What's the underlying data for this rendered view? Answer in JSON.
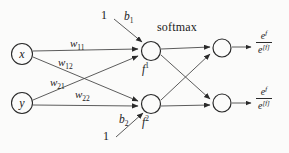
{
  "diagram": {
    "title_label": "softmax",
    "inputs": [
      {
        "id": "x",
        "label": "x"
      },
      {
        "id": "y",
        "label": "y"
      }
    ],
    "bias_constants": [
      {
        "id": "bias-top",
        "label": "1"
      },
      {
        "id": "bias-bottom",
        "label": "1"
      }
    ],
    "bias_labels": [
      {
        "id": "b1",
        "base": "b",
        "sub": "1"
      },
      {
        "id": "b2",
        "base": "b",
        "sub": "2"
      }
    ],
    "weights": [
      {
        "id": "w11",
        "base": "w",
        "sub": "11"
      },
      {
        "id": "w12",
        "base": "w",
        "sub": "12"
      },
      {
        "id": "w21",
        "base": "w",
        "sub": "21"
      },
      {
        "id": "w22",
        "base": "w",
        "sub": "22"
      }
    ],
    "hidden_nodes": [
      {
        "id": "f1",
        "base": "f",
        "sup": "1"
      },
      {
        "id": "f2",
        "base": "f",
        "sup": "2"
      }
    ],
    "outputs": [
      {
        "id": "out1",
        "numerator_base": "e",
        "numerator_sup": "f",
        "numerator_sup2": "1",
        "denominator_base": "e",
        "denominator_sup": "[f]"
      },
      {
        "id": "out2",
        "numerator_base": "e",
        "numerator_sup": "f",
        "numerator_sup2": "2",
        "denominator_base": "e",
        "denominator_sup": "[f]"
      }
    ],
    "colors": {
      "stroke": "#4a4a4a",
      "node_stroke": "#2a2a2a",
      "text": "#1a1a1a",
      "background": "#fbfbfa"
    }
  }
}
